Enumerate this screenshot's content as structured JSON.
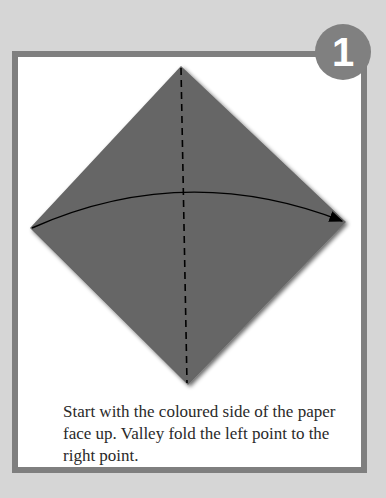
{
  "step": {
    "number": "1",
    "instruction": "Start with the coloured side of the paper face up. Valley fold the left point to the right point."
  },
  "diagram": {
    "paper_color": "#666666",
    "frame_color": "#7f7f7f",
    "background_color": "#d6d6d6",
    "fold_type": "valley fold",
    "fold_line": "vertical dashed line from top point to bottom point",
    "arrow": "curved arrow from left point to right point"
  }
}
